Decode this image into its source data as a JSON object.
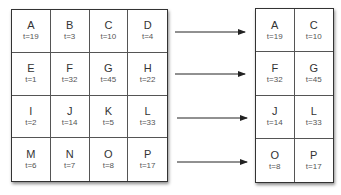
{
  "left_grid": {
    "cells": [
      {
        "name": "A",
        "t": "t=19"
      },
      {
        "name": "B",
        "t": "t=3"
      },
      {
        "name": "C",
        "t": "t=10"
      },
      {
        "name": "D",
        "t": "t=4"
      },
      {
        "name": "E",
        "t": "t=1"
      },
      {
        "name": "F",
        "t": "t=32"
      },
      {
        "name": "G",
        "t": "t=45"
      },
      {
        "name": "H",
        "t": "t=22"
      },
      {
        "name": "I",
        "t": "t=2"
      },
      {
        "name": "J",
        "t": "t=14"
      },
      {
        "name": "K",
        "t": "t=5"
      },
      {
        "name": "L",
        "t": "t=33"
      },
      {
        "name": "M",
        "t": "t=6"
      },
      {
        "name": "N",
        "t": "t=7"
      },
      {
        "name": "O",
        "t": "t=8"
      },
      {
        "name": "P",
        "t": "t=17"
      }
    ]
  },
  "right_grid": {
    "cells": [
      {
        "name": "A",
        "t": "t=19"
      },
      {
        "name": "C",
        "t": "t=10"
      },
      {
        "name": "F",
        "t": "t=32"
      },
      {
        "name": "G",
        "t": "t=45"
      },
      {
        "name": "J",
        "t": "t=14"
      },
      {
        "name": "L",
        "t": "t=33"
      },
      {
        "name": "O",
        "t": "t=8"
      },
      {
        "name": "P",
        "t": "t=17"
      }
    ]
  },
  "arrows": 4
}
